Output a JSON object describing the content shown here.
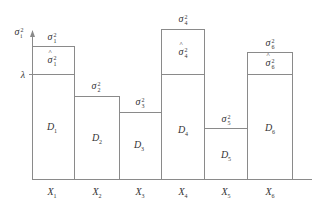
{
  "diagram": {
    "axis": {
      "y_label": {
        "base": "σ",
        "sup": "2",
        "sub": "i"
      },
      "threshold_label": "λ"
    },
    "baseline_y": 179,
    "lambda_y": 74,
    "bars": [
      {
        "id": 1,
        "x0": 32,
        "x1": 74,
        "top": 46,
        "x_label": "X",
        "x_sub": "1",
        "d_label": "D",
        "d_sub": "1",
        "sigma_label": {
          "sup": "2",
          "sub": "1"
        },
        "sigma_hat": true
      },
      {
        "id": 2,
        "x0": 74,
        "x1": 119,
        "top": 96,
        "x_label": "X",
        "x_sub": "2",
        "d_label": "D",
        "d_sub": "2",
        "sigma_label": {
          "sup": "2",
          "sub": "2"
        },
        "sigma_hat": false
      },
      {
        "id": 3,
        "x0": 119,
        "x1": 162,
        "top": 112,
        "x_label": "X",
        "x_sub": "3",
        "d_label": "D",
        "d_sub": "3",
        "sigma_label": {
          "sup": "2",
          "sub": "3"
        },
        "sigma_hat": false
      },
      {
        "id": 4,
        "x0": 162,
        "x1": 205,
        "top": 29,
        "x_label": "X",
        "x_sub": "4",
        "d_label": "D",
        "d_sub": "4",
        "sigma_label": {
          "sup": "2",
          "sub": "4"
        },
        "sigma_hat": true
      },
      {
        "id": 5,
        "x0": 205,
        "x1": 248,
        "top": 128,
        "x_label": "X",
        "x_sub": "5",
        "d_label": "D",
        "d_sub": "5",
        "sigma_label": {
          "sup": "2",
          "sub": "5"
        },
        "sigma_hat": false
      },
      {
        "id": 6,
        "x0": 248,
        "x1": 293,
        "top": 52,
        "x_label": "X",
        "x_sub": "6",
        "d_label": "D",
        "d_sub": "6",
        "sigma_label": {
          "sup": "2",
          "sub": "6"
        },
        "sigma_hat": true
      }
    ],
    "labels": {
      "x1": "X",
      "x1_sub": "1",
      "x2": "X",
      "x2_sub": "2",
      "x3": "X",
      "x3_sub": "3",
      "x4": "X",
      "x4_sub": "4",
      "x5": "X",
      "x5_sub": "5",
      "x6": "X",
      "x6_sub": "6",
      "d1": "D",
      "d1_sub": "1",
      "d2": "D",
      "d2_sub": "2",
      "d3": "D",
      "d3_sub": "3",
      "d4": "D",
      "d4_sub": "4",
      "d5": "D",
      "d5_sub": "5",
      "d6": "D",
      "d6_sub": "6",
      "sigma": "σ",
      "sq": "2",
      "s1": "1",
      "s2": "2",
      "s3": "3",
      "s4": "4",
      "s5": "5",
      "s6": "6",
      "si": "i",
      "lambda": "λ"
    },
    "line_color": "#8a8a8a"
  }
}
